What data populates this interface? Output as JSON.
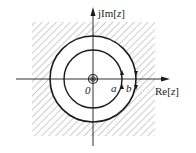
{
  "diagram": {
    "type": "complex-plane-contour",
    "axes": {
      "imag_label_prefix": "jIm[",
      "imag_label_var": "z",
      "imag_label_suffix": "]",
      "real_label_prefix": "Re[",
      "real_label_var": "z",
      "real_label_suffix": "]"
    },
    "origin_label": "0",
    "points": [
      {
        "label": "a",
        "description": "inner circle crossing on positive real axis"
      },
      {
        "label": "b",
        "description": "outer circle crossing on positive real axis"
      }
    ],
    "circles": [
      {
        "name": "inner",
        "radius_px": 29,
        "direction": "counterclockwise"
      },
      {
        "name": "outer",
        "radius_px": 43,
        "direction": "clockwise"
      }
    ],
    "shaded_region": "hatched square region outside the outer circle",
    "pole_at_origin": true,
    "colors": {
      "stroke": "#1a1a1a",
      "hatch": "#9a9a9a",
      "background": "#ffffff"
    }
  }
}
